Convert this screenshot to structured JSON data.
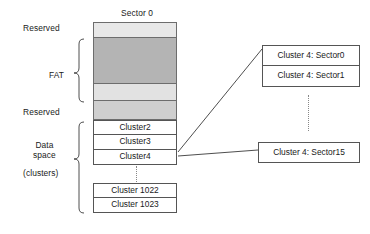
{
  "diagram": {
    "title_top": "Sector 0",
    "left_labels": {
      "reserved_top": "Reserved",
      "fat": "FAT",
      "reserved_bottom": "Reserved",
      "data_space_line1": "Data",
      "data_space_line2": "space",
      "clusters": "(clusters)"
    },
    "regions": [
      {
        "name": "reserved-top",
        "label": "Reserved",
        "fill": "#e8e8e8"
      },
      {
        "name": "fat",
        "label": "FAT",
        "fill": "#b4b4b4"
      },
      {
        "name": "reserved-bottom",
        "label": "Reserved",
        "fill": "#e2e2e2"
      }
    ],
    "cluster_rows": [
      {
        "label": "Cluster2"
      },
      {
        "label": "Cluster3"
      },
      {
        "label": "Cluster4"
      },
      {
        "label": "Cluster 1022"
      },
      {
        "label": "Cluster 1023"
      }
    ],
    "sector_boxes": [
      {
        "label": "Cluster 4: Sector0"
      },
      {
        "label": "Cluster 4: Sector1"
      },
      {
        "label": "Cluster 4: Sector15"
      }
    ],
    "colors": {
      "reserved_light": "#e8e8e8",
      "fat_dark": "#b4b4b4",
      "outline": "#555555",
      "text": "#1a1a1a",
      "dotted": "#888888"
    }
  }
}
